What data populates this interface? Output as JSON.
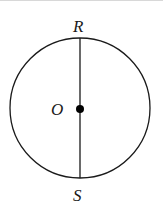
{
  "diagram": {
    "type": "circle-with-diameter",
    "circle": {
      "cx": 80,
      "cy": 108,
      "r": 70,
      "stroke": "#1a1a1a"
    },
    "diameter": {
      "from": "R",
      "to": "S"
    },
    "labels": {
      "top": "R",
      "center": "O",
      "bottom": "S"
    },
    "center_point": {
      "label": "O",
      "filled": true
    }
  }
}
